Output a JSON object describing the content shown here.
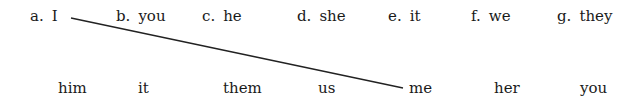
{
  "exercise": {
    "top_row": [
      {
        "letter": "a.",
        "word": "I"
      },
      {
        "letter": "b.",
        "word": "you"
      },
      {
        "letter": "c.",
        "word": "he"
      },
      {
        "letter": "d.",
        "word": "she"
      },
      {
        "letter": "e.",
        "word": "it"
      },
      {
        "letter": "f.",
        "word": "we"
      },
      {
        "letter": "g.",
        "word": "they"
      }
    ],
    "bottom_row": [
      "him",
      "it",
      "them",
      "us",
      "me",
      "her",
      "you"
    ],
    "connections": [
      {
        "from": "I",
        "to": "me",
        "line_color": "#222222"
      }
    ]
  }
}
